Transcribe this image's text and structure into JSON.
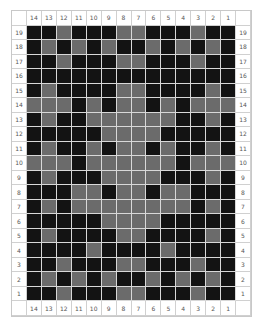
{
  "chart": {
    "column_labels": [
      "14",
      "13",
      "12",
      "11",
      "10",
      "9",
      "8",
      "7",
      "6",
      "5",
      "4",
      "3",
      "2",
      "1"
    ],
    "row_labels": [
      "19",
      "18",
      "17",
      "16",
      "15",
      "14",
      "13",
      "12",
      "11",
      "10",
      "9",
      "8",
      "7",
      "6",
      "5",
      "4",
      "3",
      "2",
      "1"
    ],
    "colors": {
      "B": "#131313",
      "G": "#6b6b6b",
      "grid": "#d8d8d8",
      "background": "#ffffff"
    },
    "legend_note": "B = dark square, G = grey square; rows listed top (19) to bottom (1), columns 14 to 1 left to right",
    "rows": [
      "BBGBBBGGBBBGBB",
      "BGBGBGBBGBGBGB",
      "BBGBBBGGBBBGBB",
      "BBBBBBBBBBBBBB",
      "BGBBBBGGBBBBGB",
      "GGGBGBGGBGBGGG",
      "BGBBGGGGGGBBGB",
      "BBBBBGGGGBBBBB",
      "BGBBGBGGBGBBGB",
      "GGGBGGGGGGBGGG",
      "BGBBBGGGGBBBGB",
      "BBBGGBGGBGGBBB",
      "BGBGGGGGGGGBGB",
      "BBBBBGGGGBBBBB",
      "BGBBBBGGBBBBGB",
      "BBBBGBBBBGBBBB",
      "BBGBBBGGBBBGBB",
      "BGBGBGBBGBGBGB",
      "BBGBBBGGBBBGBB"
    ]
  }
}
